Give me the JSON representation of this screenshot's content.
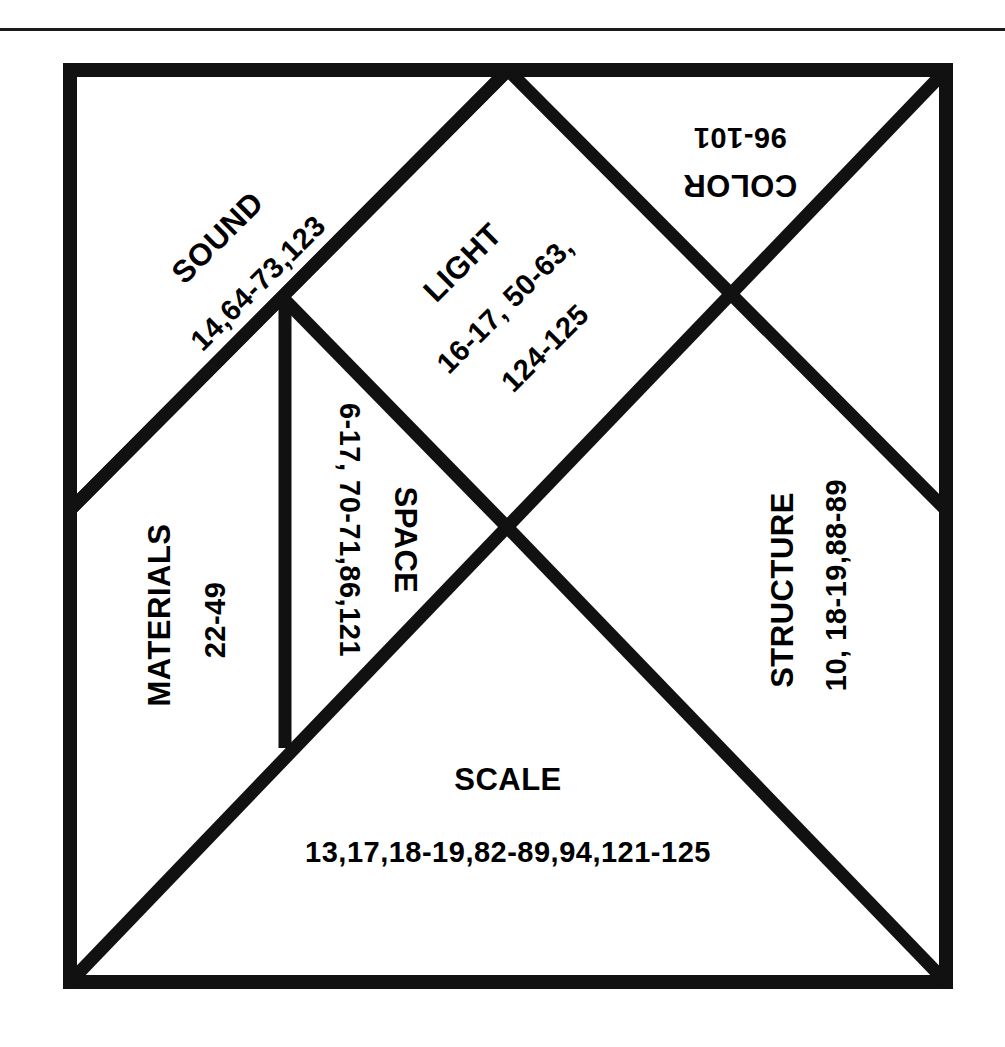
{
  "page": {
    "background_color": "#ffffff",
    "ink_color": "#111111",
    "rule_present": true
  },
  "diagram": {
    "type": "tangram",
    "shape": "square",
    "piece_count": 7,
    "pieces": [
      {
        "id": "sound",
        "piece_type": "large-triangle",
        "label": "SOUND",
        "pages": "14,64-73,123",
        "rotation_deg": -45,
        "position": "upper-left"
      },
      {
        "id": "light",
        "piece_type": "large-triangle",
        "label": "LIGHT",
        "pages_line1": "16-17, 50-63,",
        "pages_line2": "124-125",
        "rotation_deg": -45,
        "position": "upper-middle"
      },
      {
        "id": "color",
        "piece_type": "small-triangle",
        "label": "COLOR",
        "pages": "96-101",
        "rotation_deg": 180,
        "position": "upper-right"
      },
      {
        "id": "space",
        "piece_type": "small-triangle",
        "label": "SPACE",
        "pages": "6-17, 70-71,86,121",
        "rotation_deg": 90,
        "position": "center-left"
      },
      {
        "id": "materials",
        "piece_type": "square",
        "label": "MATERIALS",
        "pages": "22-49",
        "rotation_deg": -90,
        "position": "left"
      },
      {
        "id": "structure",
        "piece_type": "medium-triangle",
        "label": "STRUCTURE",
        "pages": "10, 18-19,88-89",
        "rotation_deg": -90,
        "position": "right"
      },
      {
        "id": "scale",
        "piece_type": "large-triangle",
        "label": "SCALE",
        "pages": "13,17,18-19,82-89,94,121-125",
        "rotation_deg": 0,
        "position": "bottom"
      }
    ]
  }
}
